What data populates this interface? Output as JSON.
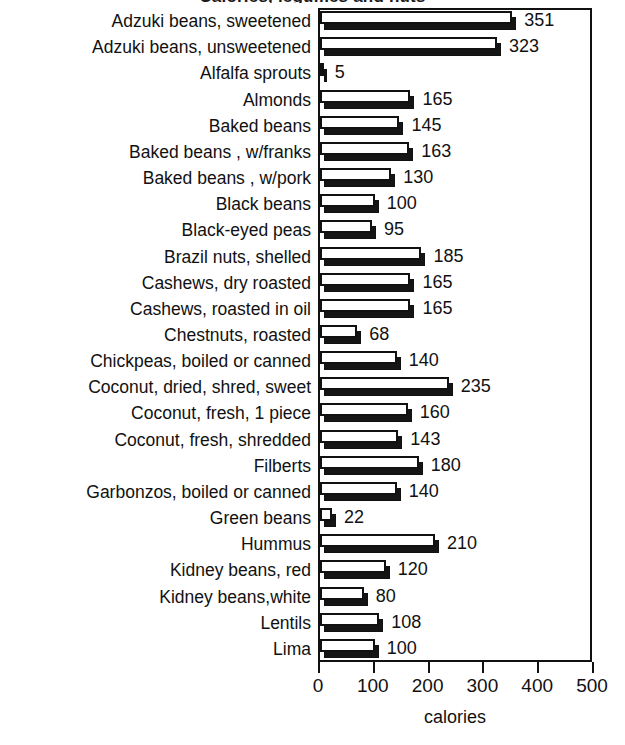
{
  "chart_data": {
    "type": "bar",
    "orientation": "horizontal",
    "title": "Calories, legumes and nuts",
    "title_clipped": true,
    "xlabel": "calories",
    "ylabel": "",
    "xlim": [
      0,
      500
    ],
    "xticks": [
      0,
      100,
      200,
      300,
      400,
      500
    ],
    "xtick_labels": [
      "0",
      "100",
      "200",
      "300",
      "400",
      "500"
    ],
    "grid": false,
    "legend": null,
    "show_value_labels": true,
    "bar_style": "3d-shadow-white-face",
    "categories": [
      "Adzuki beans, sweetened",
      "Adzuki beans, unsweetened",
      "Alfalfa sprouts",
      "Almonds",
      "Baked beans",
      "Baked beans , w/franks",
      "Baked beans , w/pork",
      "Black beans",
      "Black-eyed peas",
      "Brazil nuts, shelled",
      "Cashews, dry roasted",
      "Cashews, roasted in oil",
      "Chestnuts, roasted",
      "Chickpeas, boiled or canned",
      "Coconut, dried, shred, sweet",
      "Coconut, fresh, 1 piece",
      "Coconut, fresh, shredded",
      "Filberts",
      "Garbonzos, boiled or canned",
      "Green beans",
      "Hummus",
      "Kidney beans, red",
      "Kidney beans,white",
      "Lentils",
      "Lima"
    ],
    "values": [
      351,
      323,
      5,
      165,
      145,
      163,
      130,
      100,
      95,
      185,
      165,
      165,
      68,
      140,
      235,
      160,
      143,
      180,
      140,
      22,
      210,
      120,
      80,
      108,
      100
    ],
    "value_labels": [
      "351",
      "323",
      "5",
      "165",
      "145",
      "163",
      "130",
      "100",
      "95",
      "185",
      "165",
      "165",
      "68",
      "140",
      "235",
      "160",
      "143",
      "180",
      "140",
      "22",
      "210",
      "120",
      "80",
      "108",
      "100"
    ]
  },
  "colors": {
    "bar_face": "#ffffff",
    "bar_shadow": "#151515",
    "axis": "#111111",
    "text": "#111111",
    "background": "#ffffff"
  }
}
